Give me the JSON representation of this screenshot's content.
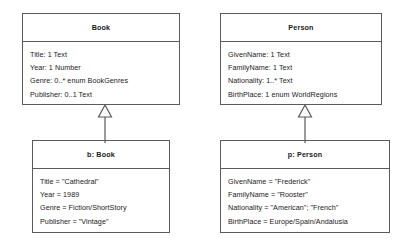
{
  "diagram": {
    "type": "uml-class-and-object-diagram",
    "line_color": "#5a5a5a",
    "text_color": "#1a1a1a",
    "background": "#ffffff",
    "relationship": "instance-of"
  },
  "classes": [
    {
      "id": "book-class",
      "name": "Book",
      "attributes": [
        "Title: 1 Text",
        "Year: 1 Number",
        "Genre: 0..* enum BookGenres",
        "Publisher: 0..1 Text"
      ]
    },
    {
      "id": "person-class",
      "name": "Person",
      "attributes": [
        "GivenName: 1 Text",
        "FamilyName: 1 Text",
        "Nationality: 1..* Text",
        "BirthPlace: 1 enum WorldRegions"
      ]
    }
  ],
  "objects": [
    {
      "id": "book-object",
      "name": "b: Book",
      "slots": [
        "Title = \"Cathedral\"",
        "Year = 1989",
        "Genre = Fiction/ShortStory",
        "Publisher = \"Vintage\""
      ]
    },
    {
      "id": "person-object",
      "name": "p: Person",
      "slots": [
        "GivenName = \"Frederick\"",
        "FamilyName = \"Rooster\"",
        "Nationality = \"American\"; \"French\"",
        "BirthPlace = Europe/Spain/Andalusia"
      ]
    }
  ],
  "arrows": [
    {
      "id": "book-instance-arrow",
      "from": "book-object",
      "to": "book-class",
      "style": "hollow-triangle"
    },
    {
      "id": "person-instance-arrow",
      "from": "person-object",
      "to": "person-class",
      "style": "hollow-triangle"
    }
  ]
}
